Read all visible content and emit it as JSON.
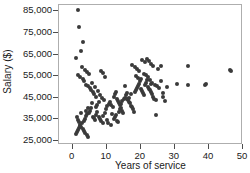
{
  "chart_data": {
    "type": "scatter",
    "title": "",
    "xlabel": "Years of service",
    "ylabel": "Salary ($)",
    "xlim": [
      -4,
      50
    ],
    "ylim": [
      23000,
      88000
    ],
    "grid": false,
    "legend": null,
    "marker": {
      "shape": "circle",
      "color": "#3a3a3a",
      "size": 4
    },
    "xticks": [
      0,
      10,
      20,
      30,
      40,
      50
    ],
    "xtick_labels": [
      "0",
      "10",
      "20",
      "30",
      "40",
      "50"
    ],
    "yticks": [
      25000,
      35000,
      45000,
      55000,
      65000,
      75000,
      85000
    ],
    "ytick_labels": [
      "25,000",
      "35,000",
      "45,000",
      "55,000",
      "65,000",
      "75,000",
      "85,000"
    ],
    "x": [
      1.7,
      2.0,
      3.1,
      2.4,
      1.1,
      1.6,
      2.2,
      3.0,
      3.4,
      4.0,
      4.5,
      5.0,
      5.4,
      6.0,
      6.3,
      7.0,
      2.8,
      3.6,
      4.2,
      4.8,
      5.6,
      6.6,
      7.4,
      8.0,
      8.6,
      9.2,
      1.2,
      1.5,
      1.8,
      2.1,
      2.5,
      2.9,
      3.3,
      3.7,
      4.1,
      4.6,
      1.0,
      1.3,
      1.6,
      1.9,
      2.3,
      2.7,
      3.2,
      3.5,
      3.9,
      4.3,
      4.7,
      5.2,
      5.5,
      5.9,
      6.2,
      6.5,
      6.9,
      7.2,
      7.6,
      8.1,
      8.4,
      8.8,
      9.0,
      9.4,
      9.8,
      10.2,
      10.6,
      11.0,
      11.4,
      11.8,
      12.0,
      12.3,
      12.6,
      12.9,
      13.2,
      13.5,
      13.8,
      14.1,
      14.4,
      14.8,
      12.2,
      12.5,
      12.8,
      13.1,
      13.4,
      13.7,
      14.0,
      14.3,
      14.6,
      15.0,
      15.3,
      15.6,
      15.9,
      16.2,
      16.5,
      16.8,
      17.1,
      17.4,
      17.7,
      18.0,
      18.3,
      18.6,
      18.9,
      19.2,
      19.5,
      19.8,
      20.1,
      20.4,
      20.7,
      21.0,
      21.3,
      21.6,
      21.9,
      22.2,
      22.5,
      22.8,
      23.1,
      23.4,
      23.7,
      24.0,
      17.5,
      18.2,
      19.0,
      19.6,
      20.3,
      21.1,
      21.8,
      22.4,
      23.0,
      23.6,
      18.5,
      19.3,
      20.0,
      20.8,
      21.5,
      22.1,
      22.7,
      23.3,
      24.2,
      24.8,
      25.4,
      26.0,
      26.6,
      27.2,
      27.8,
      25.0,
      25.8,
      26.4,
      24.5,
      30.5,
      33.8,
      34.0,
      38.8,
      39.0,
      46.2,
      46.4,
      5.8,
      7.8,
      9.6,
      10.0,
      10.4,
      11.2,
      11.6,
      16.0,
      16.6,
      17.0,
      8.2,
      9.0,
      6.8,
      7.1,
      4.4,
      3.8,
      2.6,
      15.5,
      22.9,
      24.4
    ],
    "y": [
      85500,
      78000,
      71000,
      66500,
      63500,
      55500,
      54500,
      53500,
      52500,
      51000,
      50500,
      49500,
      48500,
      47500,
      46500,
      45500,
      59000,
      58000,
      57000,
      56000,
      52000,
      50000,
      48000,
      46000,
      45000,
      44000,
      36000,
      34500,
      33500,
      32500,
      31500,
      30500,
      29500,
      28500,
      27500,
      26500,
      28000,
      29000,
      30000,
      31000,
      32000,
      33000,
      34000,
      35000,
      36500,
      37500,
      38000,
      39000,
      40000,
      36000,
      35500,
      34500,
      37000,
      38500,
      36000,
      35000,
      34000,
      33000,
      36500,
      38000,
      39500,
      41000,
      42000,
      43000,
      41500,
      40500,
      45500,
      46500,
      47500,
      44500,
      43500,
      42500,
      41500,
      40000,
      39000,
      38000,
      35000,
      36000,
      37000,
      34000,
      33500,
      38500,
      39500,
      42000,
      43500,
      44500,
      45000,
      46000,
      47000,
      44000,
      43000,
      42500,
      41000,
      40500,
      39500,
      38500,
      47500,
      48500,
      49500,
      50500,
      51500,
      52500,
      49000,
      48000,
      47000,
      46000,
      51000,
      52000,
      53000,
      50000,
      49000,
      48500,
      47500,
      46500,
      45500,
      44500,
      60000,
      59000,
      58500,
      57500,
      62500,
      61500,
      63000,
      62000,
      60500,
      59500,
      55000,
      54000,
      53500,
      56000,
      55500,
      54500,
      53000,
      52000,
      51000,
      50500,
      49500,
      52500,
      47000,
      43500,
      50000,
      58500,
      59500,
      45500,
      37000,
      51500,
      59500,
      51000,
      51000,
      51500,
      58000,
      57500,
      42500,
      43000,
      54500,
      34500,
      33000,
      32500,
      37500,
      44500,
      45000,
      46500,
      57500,
      56500,
      40500,
      41500,
      40000,
      39000,
      38000,
      50500,
      51500,
      44000
    ]
  }
}
